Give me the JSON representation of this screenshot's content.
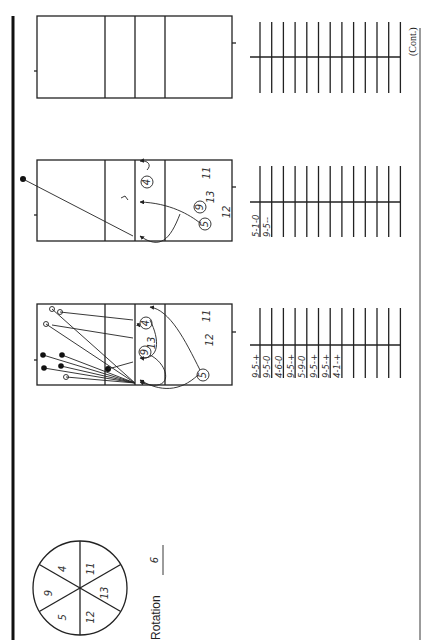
{
  "page": {
    "orientation": "rotated-90-ccw",
    "continued_label": "(Cont.)"
  },
  "rotation": {
    "label": "Rotation",
    "number": "6",
    "wheel_positions": [
      "4",
      "11",
      "13",
      "12",
      "5",
      "9"
    ]
  },
  "courts": [
    {
      "id": "court-1",
      "annotations": [
        "11",
        "12",
        "13"
      ],
      "players": [
        "4",
        "9",
        "5"
      ],
      "entries": [
        "9-5-+",
        "9-5-0",
        "4-6-0",
        "9-5-+",
        "5-9-0",
        "9-5-+",
        "9-5-+",
        "4-1-+"
      ],
      "tally_rows": 13
    },
    {
      "id": "court-2",
      "annotations": [
        "11",
        "13",
        "12"
      ],
      "players": [
        "4",
        "9",
        "5"
      ],
      "entries": [
        "5-1-0",
        "9-5--"
      ],
      "tally_rows": 13
    },
    {
      "id": "court-3",
      "annotations": [],
      "players": [],
      "entries": [],
      "tally_rows": 13
    }
  ]
}
